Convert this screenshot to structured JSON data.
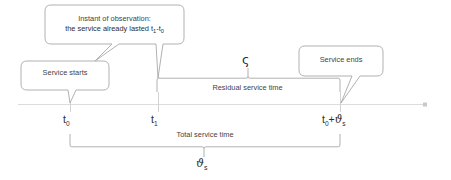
{
  "diagram": {
    "axis": {
      "name": "time-axis",
      "arrow": "right-arrow-icon",
      "color": "#d9d9d9"
    },
    "callouts": [
      {
        "id": "service-starts",
        "label": "Service starts",
        "points_to": "t0"
      },
      {
        "id": "instant-of-observation",
        "line1": "Instant of observation:",
        "line2_prefix": "the service already lasted t",
        "line2_sub1": "1",
        "line2_mid": "-t",
        "line2_sub2": "0",
        "label_plain": "Instant of observation: the service already lasted t1-t0",
        "points_to": "t1"
      },
      {
        "id": "service-ends",
        "label": "Service ends",
        "points_to": "t0+theta_s"
      }
    ],
    "ticks": [
      {
        "id": "t0",
        "base": "t",
        "sub": "0",
        "plain": "t0",
        "x": 70
      },
      {
        "id": "t1",
        "base": "t",
        "sub": "1",
        "plain": "t1",
        "x": 158
      },
      {
        "id": "t0-plus-theta-s",
        "base": "t",
        "sub": "0",
        "suffix": "+",
        "symbol": "ϑ",
        "symbol_sub": "s",
        "plain": "t0+ϑs",
        "x": 340
      }
    ],
    "brackets": [
      {
        "id": "residual-service-time",
        "label": "Residual service time",
        "symbol": "ς",
        "symbol_name": "final-sigma",
        "from": "t1",
        "to": "t0+theta_s",
        "orientation": "down"
      },
      {
        "id": "total-service-time",
        "label": "Total service time",
        "symbol": "ϑ",
        "symbol_sub": "s",
        "symbol_name": "theta-sub-s",
        "from": "t0",
        "to": "t0+theta_s",
        "orientation": "up"
      }
    ],
    "colors": {
      "text": "#3f3f3f",
      "stroke": "#a6a6a6",
      "axis": "#d9d9d9",
      "background": "#ffffff"
    }
  }
}
